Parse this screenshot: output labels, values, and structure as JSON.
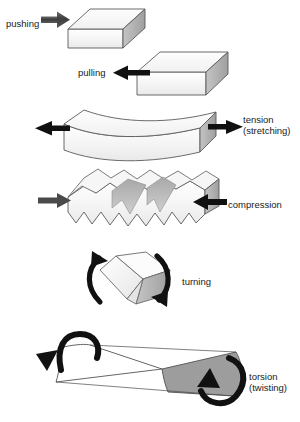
{
  "figure": {
    "width": 300,
    "height": 422,
    "background_color": "#ffffff"
  },
  "palette": {
    "outline": "#555555",
    "face_front": "#f2f2f2",
    "face_top": "#fbfbfb",
    "face_side": "#b3b3b3",
    "face_side_dark": "#9a9a9a",
    "arrow_dark": "#111111",
    "arrow_gray": "#4d4d4d",
    "text": "#1a1a1a",
    "ribbon_white": "#ffffff",
    "ribbon_gray": "#9d9d9d"
  },
  "panels": [
    {
      "id": "pushing",
      "label": "pushing",
      "label_lines": [
        "pushing"
      ],
      "label_x": 6,
      "label_y": 27,
      "label_anchor": "start",
      "arrow_color": "#4d4d4d",
      "arrow_direction": "right",
      "shape": "box",
      "description": "Gray arrow pushing into the left face of a rectangular block"
    },
    {
      "id": "pulling",
      "label": "pulling",
      "label_lines": [
        "pulling"
      ],
      "label_x": 78,
      "label_y": 76,
      "label_anchor": "start",
      "arrow_color": "#111111",
      "arrow_direction": "left",
      "shape": "box",
      "description": "Black arrow pulling away from the left face of a rectangular block"
    },
    {
      "id": "tension",
      "label": "tension (stretching)",
      "label_lines": [
        "tension",
        "(stretching)"
      ],
      "label_x": 243,
      "label_y": 123,
      "label_anchor": "start",
      "arrow_color": "#111111",
      "arrow_direction": "both-outward",
      "shape": "necked-bar",
      "description": "Two black arrows pulling outward on a block that necks in the middle"
    },
    {
      "id": "compression",
      "label": "compression",
      "label_lines": [
        "compression"
      ],
      "label_x": 228,
      "label_y": 208,
      "label_anchor": "start",
      "arrow_color": "#4d4d4d",
      "arrow_direction": "both-inward",
      "shape": "crumpled-bar",
      "description": "Two arrows pressing inward on a block that buckles into jagged folds"
    },
    {
      "id": "turning",
      "label": "turning",
      "label_lines": [
        "turning"
      ],
      "label_x": 182,
      "label_y": 285,
      "label_anchor": "start",
      "arrow_color": "#111111",
      "arrow_direction": "rotational",
      "shape": "tilted-cube",
      "description": "A tilted cube with two curved arrows on either side indicating rotation"
    },
    {
      "id": "torsion",
      "label": "torsion (twisting)",
      "label_lines": [
        "torsion",
        "(twisting)"
      ],
      "label_x": 249,
      "label_y": 380,
      "label_anchor": "start",
      "arrow_color": "#111111",
      "arrow_direction": "counter-rotational",
      "shape": "twisted-ribbon",
      "description": "A twisted ribbon, white at left and gray at right, with opposing curved arrows at each end"
    }
  ]
}
